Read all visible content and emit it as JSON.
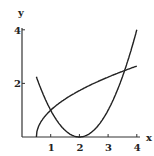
{
  "chart_data": {
    "type": "line",
    "title": "",
    "xlabel": "x",
    "ylabel": "y",
    "xlim": [
      0,
      4
    ],
    "ylim": [
      0,
      4
    ],
    "x_ticks": [
      "1",
      "2",
      "3",
      "4"
    ],
    "y_ticks": [
      "2",
      "4"
    ],
    "grid": false,
    "series": [
      {
        "name": "y = (x-2)^2",
        "x": [
          0.5,
          1,
          1.5,
          2,
          2.5,
          3,
          3.5,
          4
        ],
        "values": [
          2.25,
          1,
          0.25,
          0,
          0.25,
          1,
          2.25,
          4
        ]
      },
      {
        "name": "y = sqrt(2x-1)",
        "x": [
          0.5,
          1,
          1.5,
          2,
          2.5,
          3,
          3.5,
          4
        ],
        "values": [
          0,
          1,
          1.41,
          1.73,
          2,
          2.24,
          2.45,
          2.65
        ]
      }
    ]
  }
}
